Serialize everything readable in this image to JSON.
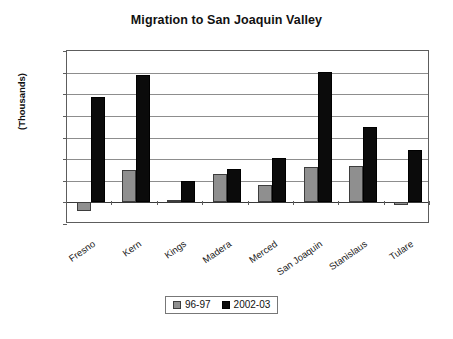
{
  "chart_data": {
    "type": "bar",
    "title": "Migration to San Joaquin Valley",
    "xlabel": "",
    "ylabel": "(Thousands)",
    "ylim": [
      -2,
      14
    ],
    "ytick_step": 2,
    "yticks": [
      14,
      12,
      10,
      8,
      6,
      4,
      2,
      0,
      -2
    ],
    "grid": true,
    "legend_position": "bottom",
    "categories": [
      "Fresno",
      "Kern",
      "Kings",
      "Madera",
      "Merced",
      "San Joaquin",
      "Stanislaus",
      "Tulare"
    ],
    "series": [
      {
        "name": "96-97",
        "color": "#8f8f8f",
        "values": [
          -0.8,
          3.0,
          0.2,
          2.6,
          1.6,
          3.3,
          3.4,
          -0.2
        ]
      },
      {
        "name": "2002-03",
        "color": "#0b0b0b",
        "values": [
          9.7,
          11.8,
          2.0,
          3.1,
          4.1,
          12.1,
          7.0,
          4.8
        ]
      }
    ]
  }
}
